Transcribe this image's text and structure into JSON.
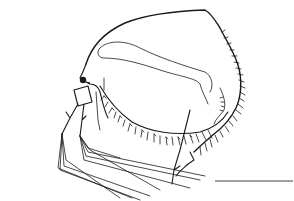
{
  "figure": {
    "background_color": "#ffffff",
    "ink_color": "#1a1a1a",
    "scale_bar": {
      "x1": 215,
      "x2": 293,
      "y": 181,
      "label": ""
    },
    "parts": [
      "carapace",
      "head-shield",
      "compound-eye",
      "ocellus",
      "antennule",
      "antenna-branches",
      "antenna-setae",
      "ventral-setae",
      "posterior-spines",
      "postabdomen",
      "gut"
    ]
  }
}
